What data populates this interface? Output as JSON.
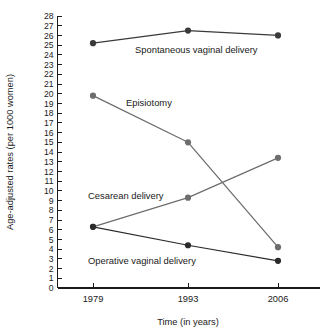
{
  "figure": {
    "title_fragment": "",
    "background": "#ffffff"
  },
  "chart_data": {
    "type": "line",
    "title": "",
    "xlabel": "Time (in years)",
    "ylabel": "Age-adjusted rates (per 1000 women)",
    "categories": [
      "1979",
      "1993",
      "2006"
    ],
    "x": [
      1979,
      1993,
      2006
    ],
    "xtick_labels": [
      "1979",
      "1993",
      "2006"
    ],
    "ytick_labels": [
      "0",
      "1",
      "2",
      "3",
      "4",
      "5",
      "6",
      "7",
      "8",
      "9",
      "10",
      "11",
      "12",
      "13",
      "14",
      "15",
      "16",
      "17",
      "18",
      "19",
      "20",
      "21",
      "22",
      "23",
      "24",
      "25",
      "26",
      "27",
      "28"
    ],
    "ylim": [
      0,
      28
    ],
    "ytick_step": 1,
    "grid": false,
    "legend_position": "inline-annotations",
    "marker": "filled-circle",
    "series": [
      {
        "name": "Spontaneous vaginal delivery",
        "label": "Spontaneous vaginal delivery",
        "values": [
          25.2,
          26.5,
          26.0
        ],
        "color": "#3a3a3a"
      },
      {
        "name": "Episiotomy",
        "label": "Episiotomy",
        "values": [
          19.8,
          15.0,
          4.2
        ],
        "color": "#6d6d6d"
      },
      {
        "name": "Cesarean delivery",
        "label": "Cesarean delivery",
        "values": [
          6.3,
          9.3,
          13.4
        ],
        "color": "#6d6d6d"
      },
      {
        "name": "Operative vaginal delivery",
        "label": "Operative vaginal delivery",
        "values": [
          6.3,
          4.4,
          2.8
        ],
        "color": "#2b2b2b"
      }
    ],
    "annotations": [
      {
        "text": "Spontaneous vaginal delivery",
        "x": 135,
        "y": 53
      },
      {
        "text": "Episiotomy",
        "x": 126,
        "y": 106
      },
      {
        "text": "Cesarean delivery",
        "x": 88,
        "y": 199
      },
      {
        "text": "Operative vaginal delivery",
        "x": 88,
        "y": 264
      }
    ]
  }
}
